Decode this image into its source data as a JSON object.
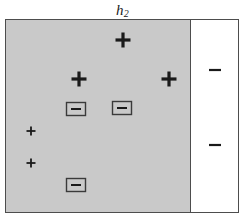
{
  "figure": {
    "title_base": "h",
    "title_sub": "2",
    "width": 245,
    "height": 219,
    "frame_color": "#4d4d4d",
    "background": "#ffffff"
  },
  "regions": [
    {
      "name": "shaded-left-region",
      "label": "shaded",
      "fill": "#c9c9c9",
      "x": 0,
      "y": 0,
      "w": 184,
      "h": 192
    },
    {
      "name": "white-right-region",
      "label": "white",
      "fill": "#ffffff",
      "x": 184,
      "y": 0,
      "w": 48,
      "h": 192
    }
  ],
  "boundary": {
    "name": "decision-boundary",
    "orientation": "vertical",
    "x": 184,
    "color": "#4d4d4d"
  },
  "markers": [
    {
      "id": "plus-top-center",
      "sign": "+",
      "x": 117,
      "y": 20,
      "size": "large",
      "boxed": false
    },
    {
      "id": "plus-mid-left",
      "sign": "+",
      "x": 73,
      "y": 59,
      "size": "large",
      "boxed": false
    },
    {
      "id": "plus-mid-right",
      "sign": "+",
      "x": 163,
      "y": 59,
      "size": "large",
      "boxed": false
    },
    {
      "id": "minus-boxed-left",
      "sign": "-",
      "x": 70,
      "y": 89,
      "size": "small",
      "boxed": true
    },
    {
      "id": "minus-boxed-right",
      "sign": "-",
      "x": 116,
      "y": 88,
      "size": "small",
      "boxed": true
    },
    {
      "id": "plus-left-upper",
      "sign": "+",
      "x": 25,
      "y": 111,
      "size": "small",
      "boxed": false
    },
    {
      "id": "plus-left-lower",
      "sign": "+",
      "x": 25,
      "y": 143,
      "size": "small",
      "boxed": false
    },
    {
      "id": "minus-boxed-bottom",
      "sign": "-",
      "x": 70,
      "y": 165,
      "size": "small",
      "boxed": true
    },
    {
      "id": "minus-right-upper",
      "sign": "-",
      "x": 209,
      "y": 50,
      "size": "small",
      "boxed": false
    },
    {
      "id": "minus-right-lower",
      "sign": "-",
      "x": 209,
      "y": 125,
      "size": "small",
      "boxed": false
    }
  ]
}
